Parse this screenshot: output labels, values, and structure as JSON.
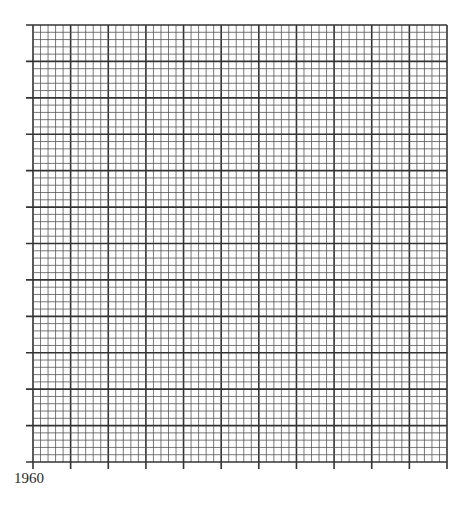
{
  "chart_data": {
    "type": "line",
    "title": "",
    "xlabel": "",
    "ylabel": "",
    "x_tick_labels": [
      "1960"
    ],
    "x_major_divisions": 11,
    "y_major_divisions": 12,
    "minor_per_major": 5,
    "grid": true,
    "series": [],
    "legend": null
  },
  "layout": {
    "left": 33,
    "top": 25,
    "right": 447,
    "bottom": 462,
    "tick_length": 7,
    "line_color": "#333333",
    "minor_color": "#555555"
  },
  "labels": {
    "x_start": "1960"
  }
}
